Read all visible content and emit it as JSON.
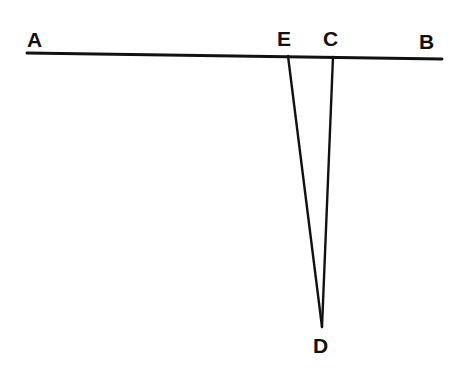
{
  "figure": {
    "kind": "geometry-line-diagram",
    "background_color": "#ffffff",
    "ink_color": "#111111",
    "stroke_width_line_ab": 3,
    "stroke_width_wedge": 2.4,
    "points": [
      {
        "id": "A",
        "label": "A",
        "x": 27,
        "y": 53,
        "label_x": 27,
        "label_y": 29,
        "on_line": "AB",
        "role": "left endpoint of line AB"
      },
      {
        "id": "E",
        "label": "E",
        "x": 288,
        "y": 56,
        "label_x": 277,
        "label_y": 28,
        "on_line": "AB",
        "role": "interior point on AB, apex of segment ED"
      },
      {
        "id": "C",
        "label": "C",
        "x": 333,
        "y": 57,
        "label_x": 323,
        "label_y": 28,
        "on_line": "AB",
        "role": "interior point on AB, apex of segment CD"
      },
      {
        "id": "B",
        "label": "B",
        "x": 442,
        "y": 59,
        "label_x": 419,
        "label_y": 31,
        "on_line": "AB",
        "role": "right endpoint of line AB"
      },
      {
        "id": "D",
        "label": "D",
        "x": 322,
        "y": 327,
        "label_x": 313,
        "label_y": 335,
        "on_line": "none",
        "role": "convergence vertex of ED and CD below the line"
      }
    ],
    "segments": [
      {
        "id": "AB",
        "label": "AB",
        "from": "A",
        "to": "B",
        "x1": 27,
        "y1": 53,
        "x2": 442,
        "y2": 59,
        "width": 3.0
      },
      {
        "id": "ED",
        "label": "ED",
        "from": "E",
        "to": "D",
        "x1": 288,
        "y1": 56,
        "x2": 322,
        "y2": 327,
        "width": 2.4
      },
      {
        "id": "CD",
        "label": "CD",
        "from": "C",
        "to": "D",
        "x1": 333,
        "y1": 57,
        "x2": 322,
        "y2": 327,
        "width": 2.4
      }
    ],
    "labels": {
      "A": "A",
      "E": "E",
      "C": "C",
      "B": "B",
      "D": "D"
    }
  }
}
